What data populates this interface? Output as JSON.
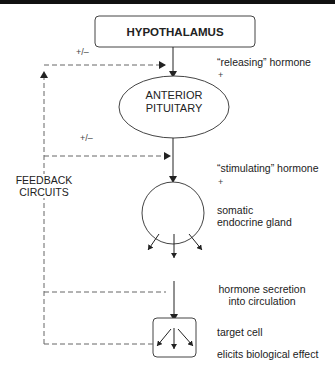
{
  "diagram": {
    "type": "flowchart",
    "nodes": {
      "hypothalamus": "HYPOTHALAMUS",
      "anterior_pituitary_line1": "ANTERIOR",
      "anterior_pituitary_line2": "PITUITARY"
    },
    "labels": {
      "releasing_hormone": "“releasing” hormone",
      "releasing_sign": "+",
      "stimulating_hormone": "“stimulating” hormone",
      "stimulating_sign": "+",
      "gland_line1": "somatic",
      "gland_line2": "endocrine gland",
      "secretion_line1": "hormone secretion",
      "secretion_line2": "into circulation",
      "target_cell": "target cell",
      "effect": "elicits biological effect",
      "feedback_line1": "FEEDBACK",
      "feedback_line2": "CIRCUITS",
      "feedback_sign_top": "+/–",
      "feedback_sign_mid": "+/–"
    },
    "colors": {
      "line": "#333333",
      "dashed": "#666666",
      "text": "#222222",
      "background": "#ffffff"
    }
  }
}
